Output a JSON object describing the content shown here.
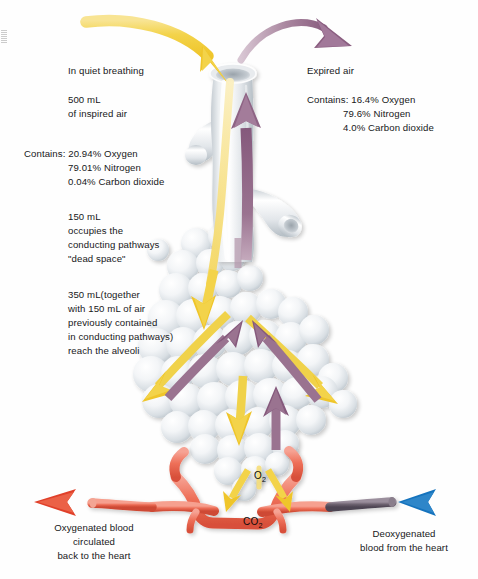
{
  "figure": {
    "background_color": "#fefefe"
  },
  "annotations": {
    "inspired": {
      "line1": "In quiet breathing",
      "line2": "500 mL",
      "line3": "of inspired air",
      "composition_label": "Contains: 20.94% Oxygen",
      "composition_line2": "79.01% Nitrogen",
      "composition_line3": "0.04% Carbon dioxide"
    },
    "expired": {
      "line1": "Expired air",
      "composition_label": "Contains: 16.4% Oxygen",
      "composition_line2": "79.6% Nitrogen",
      "composition_line3": "4.0% Carbon dioxide"
    },
    "dead_space": {
      "line1": "150 mL",
      "line2": "occupies the",
      "line3": "conducting pathways",
      "line4": "\"dead space\""
    },
    "alveolar": {
      "line1": "350 mL(together",
      "line2": "with 150 mL of air",
      "line3": "previously contained",
      "line4": "in conducting pathways)",
      "line5": "reach the alveoli"
    },
    "oxygenated": {
      "line1": "Oxygenated blood",
      "line2": "circulated",
      "line3": "back to the heart"
    },
    "deoxygenated": {
      "line1": "Deoxygenated",
      "line2": "blood from the heart"
    }
  },
  "gas_labels": {
    "oxygen": "O",
    "oxygen_sub": "2",
    "carbon_dioxide": "CO",
    "carbon_dioxide_sub": "2"
  },
  "colors": {
    "inspired_arrow": "#F2CE3C",
    "inspired_arrow_light": "#F7E08A",
    "expired_arrow": "#8E6384",
    "expired_arrow_light": "#B08EA6",
    "artery_red": "#E8503A",
    "artery_red_light": "#F08A72",
    "vein_blue": "#1D7FC4",
    "vein_dark": "#6E6470",
    "capillary_pink": "#EF7A6A",
    "alveoli_fill": "#F2F4F6",
    "alveoli_shade": "#C9D0D6",
    "airway_fill": "#EDEFF1",
    "airway_shade": "#BFC6CC",
    "text": "#17181a"
  },
  "structures": {
    "trachea": "trachea",
    "bronchus_left": "left-primary-bronchus",
    "bronchus_right": "right-primary-bronchus",
    "alveolar_cluster": "alveoli-cluster",
    "pulmonary_capillary": "pulmonary-capillary-network"
  }
}
